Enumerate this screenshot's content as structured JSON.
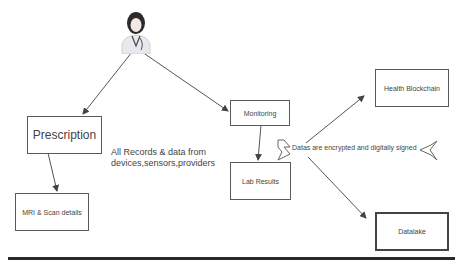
{
  "diagram": {
    "actor": {
      "icon": "doctor-avatar-icon"
    },
    "nodes": {
      "prescription": "Prescription",
      "mri": "MRI & Scan details",
      "monitoring": "Monitoring",
      "lab_results": "Lab Results",
      "health_blockchain": "Health Blockchain",
      "datalake": "Datalake"
    },
    "annotations": {
      "records_line1": "All Records &  data from",
      "records_line2": "devices,sensors,providers",
      "encryption": "Datas are encrypted and digitally signed"
    },
    "colors": {
      "line": "#555555",
      "border": "#5a5a5a",
      "rule": "#2a2a2a"
    }
  }
}
